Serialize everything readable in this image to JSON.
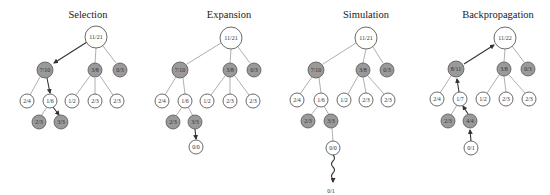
{
  "figure": {
    "colors": {
      "win_node": "#ffffff",
      "loss_node": "#9a9a9a",
      "edge": "#9a9a9a",
      "highlight_edge": "#333333"
    }
  },
  "panels": [
    {
      "title": "Selection",
      "nodes": {
        "root": "11/21",
        "a": "7/10",
        "b": "3/8",
        "c": "0/3",
        "a1": "2/4",
        "a2": "1/6",
        "b1": "1/2",
        "b2": "2/3",
        "b3": "2/3",
        "a2a": "2/3",
        "a2b": "3/3"
      }
    },
    {
      "title": "Expansion",
      "nodes": {
        "root": "11/21",
        "a": "7/10",
        "b": "3/8",
        "c": "0/3",
        "a1": "2/4",
        "a2": "1/6",
        "b1": "1/2",
        "b2": "2/3",
        "b3": "2/3",
        "a2a": "2/3",
        "a2b": "3/3",
        "new": "0/0"
      }
    },
    {
      "title": "Simulation",
      "nodes": {
        "root": "11/21",
        "a": "7/10",
        "b": "3/8",
        "c": "0/3",
        "a1": "2/4",
        "a2": "1/6",
        "b1": "1/2",
        "b2": "2/3",
        "b3": "2/3",
        "a2a": "2/3",
        "a2b": "3/3",
        "new": "0/0",
        "result": "0/1"
      }
    },
    {
      "title": "Backpropagation",
      "nodes": {
        "root": "11/22",
        "a": "8/11",
        "b": "3/8",
        "c": "0/3",
        "a1": "2/4",
        "a2": "1/7",
        "b1": "1/2",
        "b2": "2/3",
        "b3": "2/3",
        "a2a": "2/3",
        "a2b": "4/4",
        "new": "0/1"
      }
    }
  ]
}
